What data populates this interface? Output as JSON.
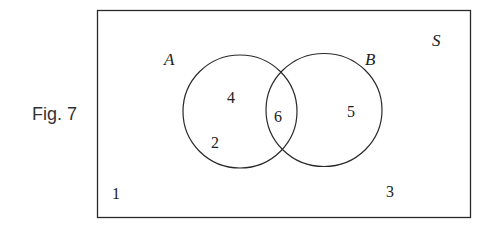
{
  "figure": {
    "caption": "Fig. 7",
    "universe_label": "S",
    "sets": [
      {
        "label": "A"
      },
      {
        "label": "B"
      }
    ],
    "regions": {
      "A_only": [
        "4",
        "2"
      ],
      "A_and_B": [
        "6"
      ],
      "B_only": [
        "5"
      ],
      "outside": [
        "1",
        "3"
      ]
    },
    "colors": {
      "stroke": "#2a2a2a",
      "text": "#222222",
      "background": "#ffffff"
    }
  }
}
